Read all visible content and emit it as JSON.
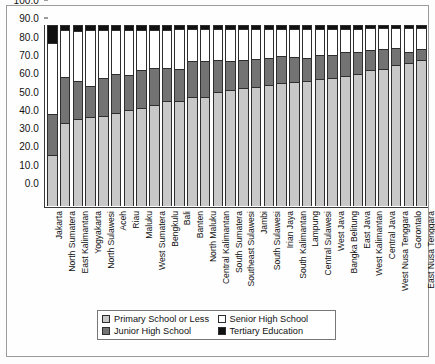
{
  "chart_data": {
    "type": "bar",
    "stacked": true,
    "stack_total": 100,
    "title": "",
    "subtitle": "",
    "xlabel": "",
    "ylabel": "",
    "ylim": [
      0,
      100
    ],
    "y_ticks": [
      "0.0",
      "10.0",
      "20.0",
      "30.0",
      "40.0",
      "50.0",
      "60.0",
      "70.0",
      "80.0",
      "90.0",
      "100.0"
    ],
    "grid": false,
    "legend_position": "bottom",
    "categories": [
      "Jakarta",
      "North Sumatera",
      "East Kalimantan",
      "Yogyakarta",
      "North Sulawesi",
      "Aceh",
      "Riau",
      "Maluku",
      "West Sumatera",
      "Bengkulu",
      "Bali",
      "Banten",
      "North Maluku",
      "Central Kalimantan",
      "South Sumatera",
      "Southeast Sulawesi",
      "Jambi",
      "South Sulawesi",
      "Irian Jaya",
      "South Kalimantan",
      "Lampung",
      "Central Sulawesi",
      "West Java",
      "Bangka Belitung",
      "East Java",
      "West Kalimantan",
      "Central Java",
      "West Nusa Tenggara",
      "Gorontalo",
      "East Nusa Tenggara"
    ],
    "series": [
      {
        "name": "Primary School or Less",
        "color": "#c8c8c8",
        "values": [
          28.0,
          46.0,
          48.0,
          49.0,
          49.5,
          51.5,
          53.0,
          54.0,
          56.0,
          58.0,
          58.0,
          60.0,
          60.5,
          63.0,
          64.0,
          65.0,
          66.0,
          67.0,
          68.0,
          68.5,
          69.0,
          70.0,
          71.0,
          72.0,
          73.0,
          75.0,
          75.5,
          78.0,
          79.0,
          80.5
        ]
      },
      {
        "name": "Junior High School",
        "color": "#737373",
        "values": [
          23.0,
          25.5,
          21.0,
          17.5,
          21.0,
          21.5,
          19.5,
          21.0,
          20.5,
          18.5,
          17.5,
          20.0,
          19.5,
          17.5,
          16.0,
          15.5,
          15.0,
          14.5,
          15.0,
          14.0,
          13.0,
          13.5,
          12.5,
          13.0,
          12.0,
          11.0,
          11.0,
          9.5,
          6.0,
          6.5
        ]
      },
      {
        "name": "Senior High School",
        "color": "#ffffff",
        "values": [
          39.0,
          25.5,
          27.5,
          30.5,
          26.5,
          24.0,
          25.0,
          22.0,
          20.5,
          21.0,
          22.5,
          18.0,
          18.0,
          17.5,
          18.0,
          17.5,
          17.0,
          16.5,
          15.0,
          15.5,
          16.0,
          14.5,
          14.5,
          13.0,
          13.0,
          12.5,
          12.0,
          11.0,
          13.5,
          11.5
        ]
      },
      {
        "name": "Tertiary Education",
        "color": "#111111",
        "values": [
          10.0,
          3.0,
          3.5,
          3.0,
          3.0,
          3.0,
          2.5,
          3.0,
          3.0,
          2.5,
          2.0,
          2.0,
          2.0,
          2.0,
          2.0,
          2.0,
          2.0,
          2.0,
          2.0,
          2.0,
          2.0,
          2.0,
          2.0,
          2.0,
          2.0,
          1.5,
          1.5,
          1.5,
          1.5,
          1.5
        ]
      }
    ],
    "legend": [
      {
        "label": "Primary School or Less",
        "swatch": "primary"
      },
      {
        "label": "Senior High School",
        "swatch": "senior"
      },
      {
        "label": "Junior High School",
        "swatch": "junior"
      },
      {
        "label": "Tertiary Education",
        "swatch": "tertiary"
      }
    ]
  }
}
